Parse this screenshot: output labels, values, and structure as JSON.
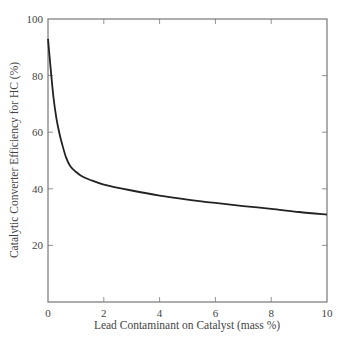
{
  "chart_data": {
    "type": "line",
    "title": "",
    "xlabel": "Lead Contaminant on Catalyst (mass %)",
    "ylabel": "Catalytic Converter Efficiency for HC (%)",
    "xlim": [
      0,
      10
    ],
    "ylim": [
      0,
      100
    ],
    "xticks": [
      0,
      2,
      4,
      6,
      8,
      10
    ],
    "yticks": [
      20,
      40,
      60,
      80,
      100
    ],
    "xtick_labels": [
      "0",
      "2",
      "4",
      "6",
      "8",
      "10"
    ],
    "ytick_labels": [
      "20",
      "40",
      "60",
      "80",
      "100"
    ],
    "grid": false,
    "legend": null,
    "series": [
      {
        "name": "HC efficiency",
        "color": "#222222",
        "x": [
          0,
          0.1,
          0.2,
          0.3,
          0.4,
          0.5,
          0.65,
          0.8,
          1.0,
          1.2,
          1.5,
          2,
          3,
          4,
          5,
          6,
          7,
          8,
          9,
          10
        ],
        "y": [
          93,
          82,
          72,
          65,
          60,
          56,
          51,
          48,
          46,
          44.5,
          43.2,
          41.5,
          39.4,
          37.6,
          36.2,
          35,
          33.9,
          32.9,
          31.8,
          30.9
        ]
      }
    ]
  },
  "colors": {
    "axis": "#777777",
    "curve": "#222222",
    "text": "#444444"
  }
}
